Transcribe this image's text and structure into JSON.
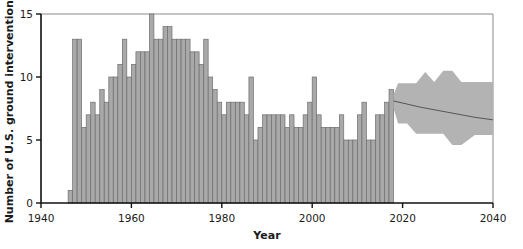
{
  "chart_data": {
    "type": "bar",
    "title": "",
    "subtitle": "",
    "xlabel": "Year",
    "ylabel": "Number of U.S. ground interventions",
    "xlim": [
      1940,
      2040
    ],
    "ylim": [
      0,
      15
    ],
    "xticks": [
      1940,
      1960,
      1980,
      2000,
      2020,
      2040
    ],
    "xticklabels": [
      "1940",
      "1960",
      "1980",
      "2000",
      "2020",
      "2040"
    ],
    "yticks": [
      0,
      5,
      10,
      15
    ],
    "yticklabels": [
      "0",
      "5",
      "10",
      "15"
    ],
    "grid": false,
    "legend": null,
    "bar_color": "#a9a9a9",
    "bar_edge_color": "#6e6e6e",
    "band_color": "#b3b3b3",
    "trend_color": "#555555",
    "categories": [
      1946,
      1947,
      1948,
      1949,
      1950,
      1951,
      1952,
      1953,
      1954,
      1955,
      1956,
      1957,
      1958,
      1959,
      1960,
      1961,
      1962,
      1963,
      1964,
      1965,
      1966,
      1967,
      1968,
      1969,
      1970,
      1971,
      1972,
      1973,
      1974,
      1975,
      1976,
      1977,
      1978,
      1979,
      1980,
      1981,
      1982,
      1983,
      1984,
      1985,
      1986,
      1987,
      1988,
      1989,
      1990,
      1991,
      1992,
      1993,
      1994,
      1995,
      1996,
      1997,
      1998,
      1999,
      2000,
      2001,
      2002,
      2003,
      2004,
      2005,
      2006,
      2007,
      2008,
      2009,
      2010,
      2011,
      2012,
      2013,
      2014,
      2015,
      2016,
      2017
    ],
    "values": [
      1,
      13,
      13,
      6,
      7,
      8,
      7,
      9,
      8,
      10,
      10,
      11,
      13,
      10,
      11,
      12,
      12,
      12,
      15,
      13,
      13,
      14,
      14,
      13,
      13,
      13,
      13,
      12,
      12,
      11,
      13,
      10,
      9,
      8,
      7,
      8,
      8,
      8,
      8,
      7,
      10,
      5,
      6,
      7,
      7,
      7,
      7,
      7,
      6,
      7,
      6,
      6,
      7,
      8,
      10,
      7,
      6,
      6,
      6,
      6,
      7,
      5,
      5,
      5,
      7,
      8,
      5,
      5,
      7,
      7,
      8,
      9
    ],
    "forecast": {
      "start_year": 2018,
      "end_year": 2040,
      "trend_years": [
        2018,
        2024,
        2030,
        2036,
        2040
      ],
      "trend_values": [
        8.1,
        7.6,
        7.2,
        6.8,
        6.6
      ],
      "band_years": [
        2018,
        2019,
        2021,
        2023,
        2025,
        2027,
        2029,
        2031,
        2033,
        2036,
        2040
      ],
      "band_upper": [
        8.6,
        9.5,
        9.5,
        9.5,
        10.4,
        9.6,
        10.5,
        10.5,
        9.6,
        9.6,
        9.6
      ],
      "band_lower": [
        7.5,
        6.3,
        6.3,
        5.5,
        5.5,
        5.5,
        5.5,
        4.6,
        4.6,
        5.4,
        5.4
      ]
    }
  }
}
